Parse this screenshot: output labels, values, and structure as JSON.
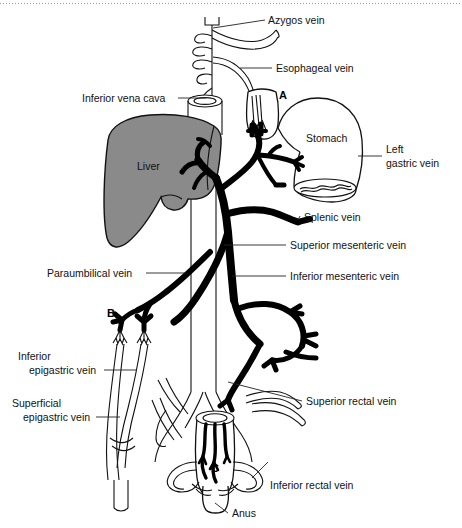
{
  "figure": {
    "background_color": "#ffffff",
    "liver_fill": "#8a8a8a",
    "vessel_color": "#000000",
    "outline_color": "#111111",
    "width": 462,
    "height": 528
  },
  "labels": {
    "azygos_vein": "Azygos vein",
    "esophageal_vein": "Esophageal vein",
    "inferior_vena_cava": "Inferior vena cava",
    "stomach": "Stomach",
    "left_gastric_vein_line1": "Left",
    "left_gastric_vein_line2": "gastric vein",
    "liver": "Liver",
    "splenic_vein": "Splenic vein",
    "superior_mesenteric_vein": "Superior mesenteric vein",
    "inferior_mesenteric_vein": "Inferior mesenteric vein",
    "paraumbilical_vein": "Paraumbilical vein",
    "inferior_epigastric_vein_line1": "Inferior",
    "inferior_epigastric_vein_line2": "epigastric vein",
    "superficial_epigastric_vein_line1": "Superficial",
    "superficial_epigastric_vein_line2": "epigastric vein",
    "superior_rectal_vein": "Superior rectal vein",
    "inferior_rectal_vein": "Inferior rectal vein",
    "anus": "Anus"
  },
  "markers": {
    "a": "A",
    "b": "B",
    "c": "C"
  }
}
